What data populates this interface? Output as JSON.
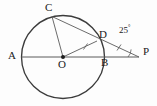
{
  "figure": {
    "kind": "circle-geometry-diagram",
    "background_color": "#fdfdfd",
    "stroke_color": "#3a3a3a",
    "thin_stroke_color": "#555555",
    "label_color": "#1a1a1a",
    "width": 157,
    "height": 106
  },
  "circle": {
    "center_label": "O",
    "cx": 63,
    "cy": 57,
    "r": 41.5
  },
  "points": [
    {
      "name": "A",
      "label": "A",
      "x": 21.5,
      "y": 57,
      "label_x": 8,
      "label_y": 51,
      "on_circle": true
    },
    {
      "name": "O",
      "label": "O",
      "x": 63,
      "y": 57,
      "label_x": 59,
      "label_y": 60,
      "on_circle": false
    },
    {
      "name": "B",
      "label": "B",
      "x": 104.5,
      "y": 57,
      "label_x": 102,
      "label_y": 58,
      "on_circle": true
    },
    {
      "name": "C",
      "label": "C",
      "x": 52,
      "y": 16.5,
      "label_x": 45,
      "label_y": 2,
      "on_circle": true
    },
    {
      "name": "D",
      "label": "D",
      "x": 97,
      "y": 41,
      "label_x": 99,
      "label_y": 30,
      "on_circle": true
    },
    {
      "name": "P",
      "label": "P",
      "x": 139,
      "y": 57,
      "label_x": 143,
      "label_y": 47,
      "on_circle": false
    }
  ],
  "segments": [
    {
      "name": "diameter-A-to-P",
      "from": "A",
      "to": "P",
      "style": "thin"
    },
    {
      "name": "chord-C-to-O",
      "from": "C",
      "to": "O",
      "style": "thin"
    },
    {
      "name": "secant-C-through-D-to-P",
      "from": "C",
      "to": "P",
      "style": "thin"
    },
    {
      "name": "radius-O-to-D",
      "from": "O",
      "to": "D",
      "style": "thin"
    }
  ],
  "tick_marks": [
    {
      "name": "tick-on-OD",
      "segment": "O-D",
      "x": 85.5,
      "y": 46.5,
      "count": 1
    },
    {
      "name": "tick-on-DP",
      "segment": "D-P",
      "x": 119,
      "y": 47.5,
      "count": 1
    }
  ],
  "angles": [
    {
      "name": "angle-at-P",
      "vertex": "P",
      "value": "25",
      "degree_symbol": "°",
      "label": "25°",
      "label_x": 120,
      "label_y": 25,
      "arc_cx": 139,
      "arc_cy": 57,
      "arc_r": 11
    }
  ],
  "center_dot": {
    "name": "center-point-marker",
    "x": 63,
    "y": 57,
    "r": 2
  }
}
